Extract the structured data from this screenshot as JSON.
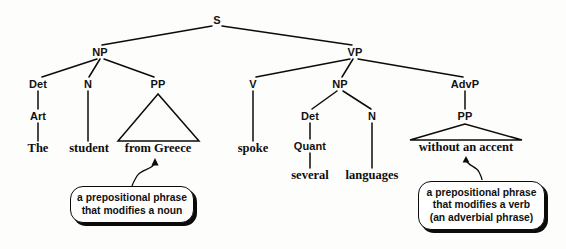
{
  "diagram": {
    "sentence": "The student from Greece spoke several languages without an accent",
    "nodes": {
      "s": "S",
      "np_subject": "NP",
      "vp": "VP",
      "det_subject": "Det",
      "n_subject": "N",
      "pp_subject": "PP",
      "art": "Art",
      "v": "V",
      "np_object": "NP",
      "advp": "AdvP",
      "det_object": "Det",
      "n_object": "N",
      "pp_advp": "PP",
      "quant": "Quant"
    },
    "terminals": {
      "the": "The",
      "student": "student",
      "from_greece": "from Greece",
      "spoke": "spoke",
      "several": "several",
      "languages": "languages",
      "without_an_accent": "without an accent"
    },
    "callout_left": {
      "line1": "a prepositional phrase",
      "line2": "that modifies a noun"
    },
    "callout_right": {
      "line1": "a prepositional phrase",
      "line2": "that modifies a verb",
      "line3": "(an adverbial phrase)"
    },
    "colors": {
      "ink": "#0b0b0b",
      "background": "#fdfdfc"
    }
  }
}
